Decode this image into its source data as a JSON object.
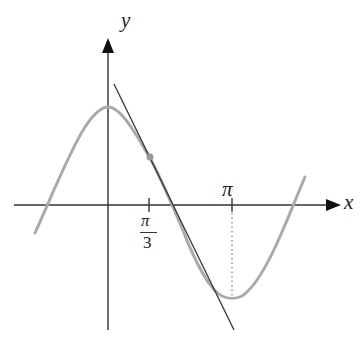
{
  "diagram": {
    "type": "function graph with tangent line",
    "axes": {
      "x_label": "x",
      "y_label": "y"
    },
    "ticks": {
      "pi_third": {
        "numerator": "π",
        "denominator": "3"
      },
      "pi": "π"
    },
    "curve": {
      "description": "y = cos x (gray)",
      "color": "#aaaaaa"
    },
    "tangent": {
      "description": "tangent line at x = π/3",
      "color": "#333333"
    },
    "point_of_tangency": {
      "x": "π/3",
      "color": "#999999"
    },
    "dotted_guide": {
      "x": "π",
      "description": "dotted vertical line from π tick to curve minimum"
    }
  },
  "colors": {
    "axes": "#333333",
    "curve": "#aaaaaa",
    "tangent": "#333333",
    "background": "#ffffff"
  }
}
